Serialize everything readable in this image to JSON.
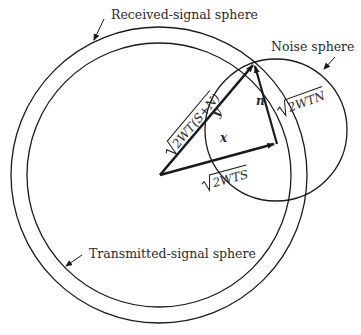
{
  "figure": {
    "labels": {
      "received_signal_sphere": "Received-signal sphere",
      "transmitted_signal_sphere": "Transmitted-signal sphere",
      "noise_sphere": "Noise sphere"
    },
    "vector_labels": {
      "received_magnitude": "2WT(S+N)",
      "signal_magnitude": "2WTS",
      "noise_magnitude": "2WTN",
      "x": "x",
      "y": "y",
      "n": "n"
    },
    "colors": {
      "line": "#1a1a1a",
      "text": "#2a2a2a",
      "background": "#ffffff"
    }
  }
}
